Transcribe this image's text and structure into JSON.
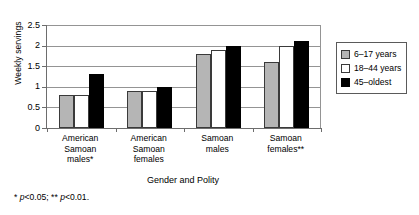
{
  "chart_data": {
    "type": "bar",
    "title": "",
    "xlabel": "Gender and Polity",
    "ylabel": "Weekly servings",
    "categories": [
      "American Samoan males*",
      "American Samoan females",
      "Samoan males",
      "Samoan females**"
    ],
    "category_lines": [
      [
        "American",
        "Samoan",
        "males*"
      ],
      [
        "American",
        "Samoan",
        "females"
      ],
      [
        "Samoan",
        "males"
      ],
      [
        "Samoan",
        "females**"
      ]
    ],
    "series": [
      {
        "name": "6–17 years",
        "values": [
          0.8,
          0.9,
          1.8,
          1.6
        ],
        "color": "#b5b5b5"
      },
      {
        "name": "18–44 years",
        "values": [
          0.8,
          0.9,
          1.9,
          2.0
        ],
        "color": "#ffffff"
      },
      {
        "name": "45–oldest",
        "values": [
          1.3,
          1.0,
          2.0,
          2.1
        ],
        "color": "#000000"
      }
    ],
    "ylim": [
      0,
      2.5
    ],
    "yticks": [
      0,
      0.5,
      1,
      1.5,
      2,
      2.5
    ],
    "ytick_labels": [
      "0",
      "0.5",
      "1",
      "1.5",
      "2",
      "2.5"
    ],
    "grid": "horizontal",
    "legend_position": "right"
  },
  "legend": {
    "items": [
      {
        "label": "6–17 years"
      },
      {
        "label": "18–44 years"
      },
      {
        "label": "45–oldest"
      }
    ]
  },
  "footnote": {
    "text": "* p<0.05; ** p<0.01."
  }
}
